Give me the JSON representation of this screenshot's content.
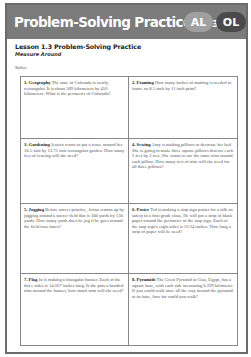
{
  "banner": {
    "title": "Problem-Solving Practice",
    "page_ref": "(p. 37)",
    "badges": [
      "AL",
      "OL"
    ]
  },
  "lesson": {
    "title": "Lesson 1.3 Problem-Solving Practice",
    "subtitle": "Measure Around",
    "instruction": "Solve."
  },
  "problems": [
    {
      "number": "1.",
      "topic": "Geography",
      "text": "The state of Colorado is nearly rectangular. It is about 589 kilometers by 456 kilometers. What is the perimeter of Colorado?"
    },
    {
      "number": "2.",
      "topic": "Framing",
      "text": "How many inches of matting is needed to frame an 8.5 inch by 11 inch print?"
    },
    {
      "number": "3.",
      "topic": "Gardening",
      "text": "Jessica wants to put a fence around her 10.5 foot by 13.75 foot rectangular garden. How many feet of fencing will she need?"
    },
    {
      "number": "4.",
      "topic": "Sewing",
      "text": "Amy is making pillows to decorate her bed. She is going to make three square pillows that are each 2 feet by 2 feet. She wants to use the same trim around each pillow. How many feet of trim will she need for all three pillows?"
    },
    {
      "number": "5.",
      "topic": "Jogging",
      "text": "Before soccer practice, Jovan warms up by jogging around a soccer field that is 100 yards by 130 yards. How many yards does he jog if he goes around the field four times?"
    },
    {
      "number": "6.",
      "topic": "Poster",
      "text": "Ted is making a stop sign poster for a talk on safety to a first grade class. He will put a strip of black paper around the perimeter of the stop sign. Each of the stop sign's eight sides is 16.34 inches. How long a strip of paper will he need?"
    },
    {
      "number": "7.",
      "topic": "Flag",
      "text": "Jo is making a triangular banner. Each of the three sides is 14.367 inches long. If she puts a braided trim around the banner, how much trim will she need?"
    },
    {
      "number": "8.",
      "topic": "Pyramids",
      "text": "The Great Pyramid at Giza, Egypt, has a square base, with each side measuring 0.229 kilometer. If you could walk once all the way around the pyramid at its base, how far could you walk?"
    }
  ]
}
